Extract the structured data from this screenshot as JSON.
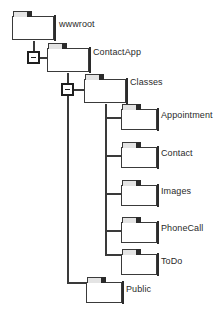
{
  "diagram": {
    "type": "folder-tree",
    "colors": {
      "line": "#3a3a3a",
      "folder_fill": "#ffffff",
      "folder_stroke": "#3a3a3a",
      "folder_tab": "#e4e4e4",
      "folder_tab_dark": "#2b2b2b",
      "text": "#2a2a2a",
      "background": "#ffffff"
    },
    "nodes": [
      {
        "id": "wwwroot",
        "label": "wwwroot",
        "level": 0,
        "expanded": true
      },
      {
        "id": "contactapp",
        "label": "ContactApp",
        "level": 1,
        "expanded": true
      },
      {
        "id": "classes",
        "label": "Classes",
        "level": 2,
        "expanded": true
      },
      {
        "id": "appointment",
        "label": "Appointment",
        "level": 3,
        "expanded": false
      },
      {
        "id": "contact",
        "label": "Contact",
        "level": 3,
        "expanded": false
      },
      {
        "id": "images",
        "label": "Images",
        "level": 3,
        "expanded": false
      },
      {
        "id": "phonecall",
        "label": "PhoneCall",
        "level": 3,
        "expanded": false
      },
      {
        "id": "todo",
        "label": "ToDo",
        "level": 3,
        "expanded": false
      },
      {
        "id": "public",
        "label": "Public",
        "level": 2,
        "expanded": false
      }
    ],
    "expanders": [
      {
        "id": "expander-wwwroot",
        "state": "minus",
        "owner": "wwwroot"
      },
      {
        "id": "expander-contactapp",
        "state": "minus",
        "owner": "contactapp"
      }
    ],
    "icons": {
      "folder": "folder-icon",
      "expander_collapse": "minus-box-icon"
    }
  }
}
